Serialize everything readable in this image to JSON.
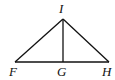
{
  "diagram": {
    "type": "geometry-triangle-with-altitude",
    "points": {
      "I": {
        "label": "I",
        "x": 63,
        "y": 19
      },
      "F": {
        "label": "F",
        "x": 15,
        "y": 62
      },
      "G": {
        "label": "G",
        "x": 63,
        "y": 62
      },
      "H": {
        "label": "H",
        "x": 109,
        "y": 62
      }
    },
    "segments": [
      {
        "from": "I",
        "to": "F"
      },
      {
        "from": "I",
        "to": "H"
      },
      {
        "from": "F",
        "to": "H"
      },
      {
        "from": "I",
        "to": "G"
      }
    ],
    "labels": {
      "I": "I",
      "F": "F",
      "G": "G",
      "H": "H"
    },
    "colors": {
      "stroke": "#111111",
      "background": "#ffffff"
    }
  }
}
